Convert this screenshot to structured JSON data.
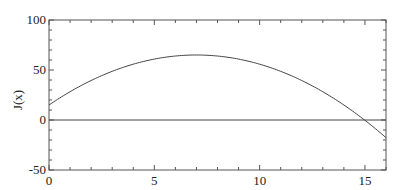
{
  "chart_data": {
    "type": "line",
    "title": "",
    "xlabel": "",
    "ylabel": "J(x)",
    "xlim": [
      0,
      16
    ],
    "ylim": [
      -50,
      100
    ],
    "x_ticks": [
      0,
      5,
      10,
      15
    ],
    "y_ticks": [
      -50,
      0,
      50,
      100
    ],
    "x_tick_labels": [
      "0",
      "5",
      "10",
      "15"
    ],
    "y_tick_labels": [
      "-50",
      "0",
      "50",
      "100"
    ],
    "grid": false,
    "legend": null,
    "series": [
      {
        "name": "J(x)",
        "x": [
          0,
          1,
          2,
          3,
          4,
          5,
          6,
          7,
          8,
          9,
          10,
          11,
          12,
          13,
          14,
          15,
          16
        ],
        "values": [
          15,
          28.3,
          39.5,
          48.7,
          55.8,
          60.9,
          64,
          65,
          64,
          60.9,
          55.8,
          48.7,
          39.5,
          28.3,
          15,
          -0.3,
          -17.7
        ]
      },
      {
        "name": "zero-line",
        "x": [
          0,
          16
        ],
        "values": [
          0,
          0
        ]
      }
    ],
    "colors": {
      "curve": "#444444",
      "axis": "#555555",
      "text": "#222222"
    }
  }
}
